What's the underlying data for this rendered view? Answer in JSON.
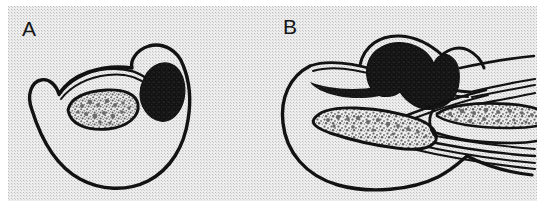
{
  "figure": {
    "kind": "scientific-line-drawing",
    "background_color": "#ededed",
    "page_color": "#ffffff",
    "ink_color": "#121212",
    "stipple_color": "#7a7a7a",
    "dark_mass_color": "#141414",
    "panels": [
      {
        "id": "A",
        "label": "A",
        "label_x": 22,
        "label_y": 18,
        "view": "transverse-section",
        "features": [
          {
            "name": "outer-body-outline",
            "style": "closed-contour",
            "fill": "none"
          },
          {
            "name": "left-notch",
            "style": "v-shaped-indentation"
          },
          {
            "name": "inner-arc-double-line",
            "style": "double-stroke-arc"
          },
          {
            "name": "stippled-oval",
            "style": "outlined-oval-with-granular-fill",
            "fill": "stipple"
          },
          {
            "name": "dark-mass",
            "style": "solid-filled-oval",
            "fill": "#141414"
          }
        ]
      },
      {
        "id": "B",
        "label": "B",
        "label_x": 283,
        "label_y": 16,
        "view": "sagittal-section",
        "features": [
          {
            "name": "outer-body-outline",
            "style": "open-contour-extending-right",
            "fill": "none"
          },
          {
            "name": "dark-hooked-mass",
            "style": "solid-filled-hook",
            "fill": "#141414"
          },
          {
            "name": "stippled-rod-left",
            "style": "elongated-outline-with-granular-fill",
            "fill": "stipple"
          },
          {
            "name": "stippled-rod-right",
            "style": "elongated-outline-with-granular-fill",
            "fill": "stipple"
          },
          {
            "name": "upper-parallel-lines",
            "style": "fan-of-thin-strokes",
            "count": 4
          },
          {
            "name": "lower-parallel-lines",
            "style": "fan-of-thin-strokes",
            "count": 4
          },
          {
            "name": "central-oblique-band",
            "style": "tapered-double-stroke"
          }
        ]
      }
    ]
  }
}
